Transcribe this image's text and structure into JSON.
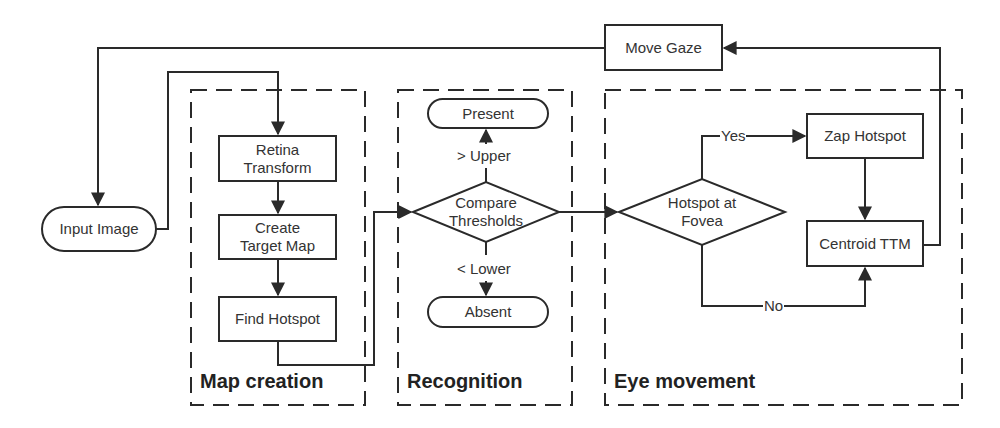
{
  "diagram": {
    "type": "flowchart",
    "groups": [
      {
        "id": "map_creation",
        "label": "Map creation"
      },
      {
        "id": "recognition",
        "label": "Recognition"
      },
      {
        "id": "eye_movement",
        "label": "Eye movement"
      }
    ],
    "nodes": {
      "move_gaze": {
        "label": "Move Gaze",
        "shape": "rectangle"
      },
      "input_image": {
        "label": "Input Image",
        "shape": "rounded"
      },
      "retina_transform": {
        "label_line1": "Retina",
        "label_line2": "Transform",
        "shape": "rectangle"
      },
      "create_target_map": {
        "label_line1": "Create",
        "label_line2": "Target Map",
        "shape": "rectangle"
      },
      "find_hotspot": {
        "label": "Find Hotspot",
        "shape": "rectangle"
      },
      "present": {
        "label": "Present",
        "shape": "rounded"
      },
      "compare_thresholds": {
        "label_line1": "Compare",
        "label_line2": "Thresholds",
        "shape": "diamond"
      },
      "absent": {
        "label": "Absent",
        "shape": "rounded"
      },
      "hotspot_at_fovea": {
        "label_line1": "Hotspot at",
        "label_line2": "Fovea",
        "shape": "diamond"
      },
      "zap_hotspot": {
        "label": "Zap Hotspot",
        "shape": "rectangle"
      },
      "centroid_ttm": {
        "label": "Centroid TTM",
        "shape": "rectangle"
      }
    },
    "edge_labels": {
      "upper": "> Upper",
      "lower": "< Lower",
      "yes": "Yes",
      "no": "No"
    },
    "edges": [
      {
        "from": "move_gaze",
        "to": "input_image"
      },
      {
        "from": "input_image",
        "to": "retina_transform"
      },
      {
        "from": "retina_transform",
        "to": "create_target_map"
      },
      {
        "from": "create_target_map",
        "to": "find_hotspot"
      },
      {
        "from": "find_hotspot",
        "to": "compare_thresholds"
      },
      {
        "from": "compare_thresholds",
        "to": "present",
        "label": "> Upper"
      },
      {
        "from": "compare_thresholds",
        "to": "absent",
        "label": "< Lower"
      },
      {
        "from": "compare_thresholds",
        "to": "hotspot_at_fovea"
      },
      {
        "from": "hotspot_at_fovea",
        "to": "zap_hotspot",
        "label": "Yes"
      },
      {
        "from": "hotspot_at_fovea",
        "to": "centroid_ttm",
        "label": "No"
      },
      {
        "from": "zap_hotspot",
        "to": "centroid_ttm"
      },
      {
        "from": "centroid_ttm",
        "to": "move_gaze"
      }
    ],
    "colors": {
      "stroke": "#2a2a2a",
      "text": "#333333",
      "background": "#ffffff"
    }
  }
}
